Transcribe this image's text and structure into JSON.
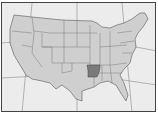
{
  "map": {
    "title": "",
    "region": "Contiguous United States",
    "highlighted_state": "Arkansas",
    "colors": {
      "background": "#ececec",
      "land": "#cfcfcf",
      "highlight": "#7a7a7a",
      "border": "#555555",
      "graticule": "#666666"
    }
  }
}
